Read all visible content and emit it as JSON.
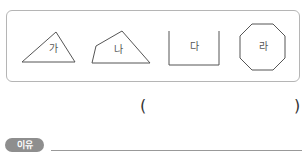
{
  "shapes": [
    {
      "id": "ga",
      "label": "가",
      "type": "triangle",
      "closed": true
    },
    {
      "id": "na",
      "label": "나",
      "type": "quadrilateral",
      "closed": true
    },
    {
      "id": "da",
      "label": "다",
      "type": "open-figure",
      "closed": false
    },
    {
      "id": "ra",
      "label": "라",
      "type": "octagon",
      "closed": true
    }
  ],
  "answer": {
    "open_paren": "(",
    "close_paren": ")",
    "value": ""
  },
  "reason": {
    "badge_label": "이유",
    "value": ""
  },
  "colors": {
    "stroke": "#555555",
    "box_border": "#b5b5b5",
    "badge_bg": "#8e8e8e"
  }
}
